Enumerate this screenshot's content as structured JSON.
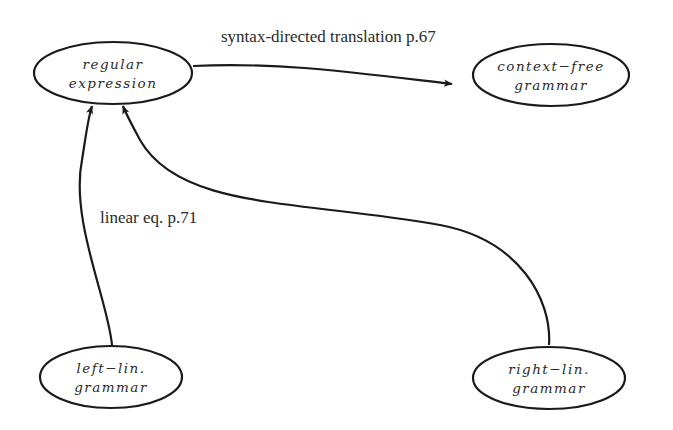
{
  "diagram": {
    "nodes": [
      {
        "id": "regular-expression",
        "line1": "regular",
        "line2": "expression"
      },
      {
        "id": "context-free-grammar",
        "line1": "context−free",
        "line2": "grammar"
      },
      {
        "id": "left-linear-grammar",
        "line1": "left−lin.",
        "line2": "grammar"
      },
      {
        "id": "right-linear-grammar",
        "line1": "right−lin.",
        "line2": "grammar"
      }
    ],
    "edges": [
      {
        "from": "regular-expression",
        "to": "context-free-grammar",
        "label": "syntax-directed translation p.67"
      },
      {
        "from": "left-linear-grammar",
        "to": "regular-expression",
        "label": "linear eq. p.71"
      },
      {
        "from": "right-linear-grammar",
        "to": "regular-expression",
        "label": ""
      }
    ],
    "colors": {
      "stroke": "#1a1a1a",
      "background": "#ffffff",
      "text": "#2a2a2a"
    }
  }
}
